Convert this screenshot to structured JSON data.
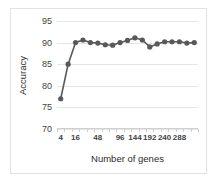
{
  "chart_data": {
    "type": "line",
    "title": "",
    "xlabel": "Number of genes",
    "ylabel": "Accuracy",
    "ylim": [
      70,
      95
    ],
    "yticks": [
      70,
      75,
      80,
      85,
      90,
      95
    ],
    "xticks": [
      4,
      16,
      48,
      96,
      144,
      192,
      240,
      288
    ],
    "grid": true,
    "legend": "none",
    "marker": "circle",
    "series_color": "#595959",
    "x": [
      4,
      8,
      16,
      24,
      32,
      48,
      64,
      80,
      96,
      120,
      144,
      168,
      192,
      216,
      240,
      264,
      288,
      312,
      336
    ],
    "values": [
      77.0,
      85.0,
      90.0,
      90.6,
      90.0,
      89.9,
      89.5,
      89.4,
      90.0,
      90.5,
      91.1,
      90.6,
      89.0,
      89.7,
      90.2,
      90.2,
      90.2,
      89.9,
      90.0
    ],
    "series": [
      {
        "name": "Accuracy",
        "values": [
          77.0,
          85.0,
          90.0,
          90.6,
          90.0,
          89.9,
          89.5,
          89.4,
          90.0,
          90.5,
          91.1,
          90.6,
          89.0,
          89.7,
          90.2,
          90.2,
          90.2,
          89.9,
          90.0
        ]
      }
    ]
  },
  "axis": {
    "y_title": "Accuracy",
    "x_title": "Number of genes"
  }
}
